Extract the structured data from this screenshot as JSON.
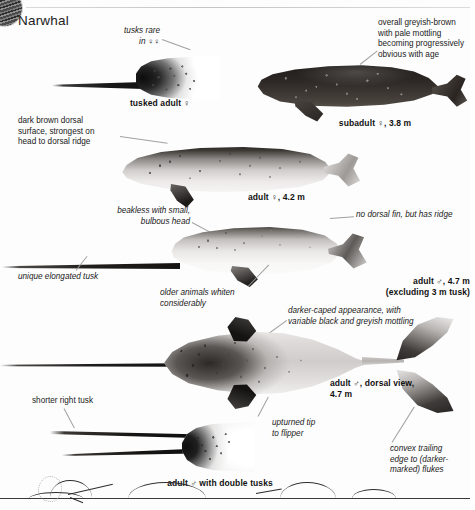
{
  "page": {
    "title": "Narwhal",
    "thumbnail_icon": "narwhal-thumbnail-icon"
  },
  "figures": [
    {
      "id": "tusked-adult-female",
      "caption": "tusked adult ♀",
      "notes": [
        "tusks rare",
        "in ♀♀"
      ]
    },
    {
      "id": "subadult-female",
      "caption": "subadult ♀, 3.8 m",
      "notes": [
        "overall greyish-brown",
        "with pale mottling",
        "becoming progressively",
        "obvious with age"
      ]
    },
    {
      "id": "adult-female",
      "caption": "adult ♀, 4.2 m",
      "notes": [
        "dark brown dorsal",
        "surface, strongest on",
        "head to dorsal ridge"
      ]
    },
    {
      "id": "adult-male-lateral",
      "caption_line1": "adult ♂, 4.7 m",
      "caption_line2": "(excluding 3 m tusk)",
      "notes": [
        "beakless with small,",
        "bulbous head",
        "unique elongated tusk",
        "older animals whiten",
        "considerably",
        "no dorsal fin, but has ridge"
      ]
    },
    {
      "id": "adult-male-dorsal",
      "caption_line1": "adult ♂, dorsal view,",
      "caption_line2": "4.7 m",
      "notes": [
        "darker-caped appearance, with",
        "variable black and greyish mottling",
        "upturned tip",
        "to flipper",
        "convex trailing",
        "edge to (darker-",
        "marked) flukes"
      ]
    },
    {
      "id": "adult-male-double-tusks",
      "caption": "adult ♂ with double tusks",
      "notes": [
        "shorter right tusk"
      ]
    },
    {
      "id": "surfacing-sequence",
      "caption": "",
      "notes": []
    }
  ],
  "labels": {
    "title": "Narwhal",
    "tusks_rare_l1": "tusks rare",
    "tusks_rare_l2": "in ♀♀",
    "tusked_adult_female": "tusked adult ♀",
    "greyish_l1": "overall greyish-brown",
    "greyish_l2": "with pale mottling",
    "greyish_l3": "becoming progressively",
    "greyish_l4": "obvious with age",
    "subadult_caption": "subadult ♀, 3.8 m",
    "dark_brown_l1": "dark brown dorsal",
    "dark_brown_l2": "surface, strongest on",
    "dark_brown_l3": "head to dorsal ridge",
    "adult_female_caption": "adult ♀, 4.2 m",
    "beakless_l1": "beakless with small,",
    "beakless_l2": "bulbous head",
    "no_dorsal_fin": "no dorsal fin, but has ridge",
    "unique_tusk": "unique elongated tusk",
    "older_whiten_l1": "older animals whiten",
    "older_whiten_l2": "considerably",
    "adult_male_caption_l1": "adult ♂, 4.7 m",
    "adult_male_caption_l2": "(excluding 3 m tusk)",
    "darker_caped_l1": "darker-caped appearance, with",
    "darker_caped_l2": "variable black and greyish mottling",
    "dorsal_caption_l1": "adult ♂, dorsal view,",
    "dorsal_caption_l2": "4.7 m",
    "shorter_right_tusk": "shorter right tusk",
    "upturned_l1": "upturned tip",
    "upturned_l2": "to flipper",
    "convex_l1": "convex trailing",
    "convex_l2": "edge to (darker-",
    "convex_l3": "marked) flukes",
    "double_tusks_caption": "adult ♂ with double tusks"
  },
  "colors": {
    "background": "#fdfdfd",
    "text": "#111111",
    "leader_line": "#a0a0a0",
    "rule": "#d2d2d2",
    "dark_body": "#2c2724",
    "pale_body": "#eceae9"
  }
}
